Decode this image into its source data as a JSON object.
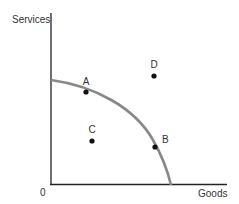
{
  "diagram": {
    "type": "production-possibilities-frontier",
    "y_axis_label": "Services",
    "x_axis_label": "Goods",
    "origin_label": "0",
    "points": [
      {
        "label": "A",
        "x": 86,
        "y": 92,
        "label_dx": 0,
        "label_dy": -7
      },
      {
        "label": "B",
        "x": 155,
        "y": 147,
        "label_dx": 7,
        "label_dy": -4
      },
      {
        "label": "C",
        "x": 92,
        "y": 141,
        "label_dx": 0,
        "label_dy": -8
      },
      {
        "label": "D",
        "x": 154,
        "y": 76,
        "label_dx": 0,
        "label_dy": -8
      }
    ],
    "colors": {
      "axis": "#222222",
      "curve": "#888888",
      "point": "#111111",
      "text": "#333333"
    }
  }
}
